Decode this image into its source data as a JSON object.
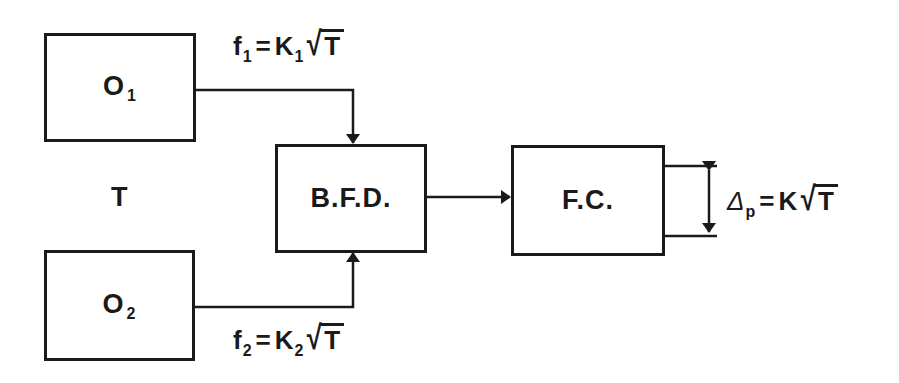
{
  "diagram": {
    "type": "block-diagram",
    "nodes": [
      {
        "id": "o1",
        "label": "O",
        "sub": "1"
      },
      {
        "id": "o2",
        "label": "O",
        "sub": "2"
      },
      {
        "id": "bfd",
        "label": "B.F.D."
      },
      {
        "id": "fc",
        "label": "F.C."
      }
    ],
    "side_label": "T",
    "edges": [
      {
        "from": "o1",
        "to": "bfd",
        "label": {
          "var": "f",
          "var_sub": "1",
          "op": "=",
          "coef": "K",
          "coef_sub": "1",
          "radicand": "T"
        }
      },
      {
        "from": "o2",
        "to": "bfd",
        "label": {
          "var": "f",
          "var_sub": "2",
          "op": "=",
          "coef": "K",
          "coef_sub": "2",
          "radicand": "T"
        }
      },
      {
        "from": "bfd",
        "to": "fc"
      }
    ],
    "output": {
      "var": "Δ",
      "var_sub": "p",
      "op": "=",
      "coef": "K",
      "radical": "√",
      "radicand": "T"
    },
    "radical_symbol": "√",
    "stroke_color": "#1a1a1a",
    "background": "#ffffff"
  }
}
